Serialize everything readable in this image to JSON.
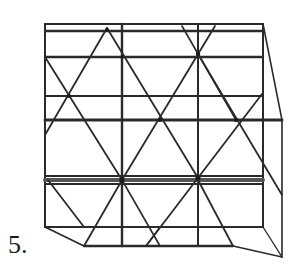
{
  "figure": {
    "label": "5.",
    "stroke_color": "#2a2a2a",
    "background": "#ffffff"
  }
}
